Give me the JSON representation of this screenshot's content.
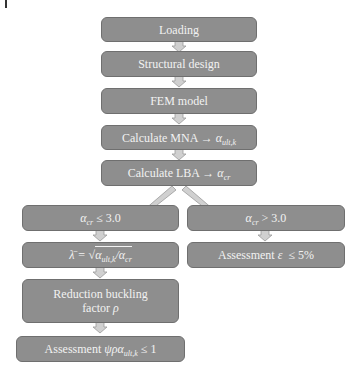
{
  "figure": {
    "corner_mark": "|",
    "nodes": {
      "loading": "Loading",
      "structural_design": "Structural design",
      "fem_model": "FEM model",
      "mna": {
        "prefix": "Calculate MNA → ",
        "symbol": "α",
        "sub": "ult,k"
      },
      "lba": {
        "prefix": "Calculate LBA → ",
        "symbol": "α",
        "sub": "cr"
      },
      "branch_left": {
        "symbol": "α",
        "sub": "cr",
        "suffix": " ≤ 3.0"
      },
      "branch_right": {
        "symbol": "α",
        "sub": "cr",
        "suffix": " > 3.0"
      },
      "slenderness": {
        "lhs": "λ̄ = √",
        "a1": "α",
        "s1": "ult,k",
        "sep": "/",
        "a2": "α",
        "s2": "cr"
      },
      "reduction": {
        "line1": "Reduction buckling",
        "line2_prefix": "factor ",
        "line2_symbol": "ρ"
      },
      "assessment_left": {
        "prefix": "Assessment ",
        "symbol": "ψρα",
        "sub": "ult,k",
        "suffix": " ≤ 1"
      },
      "assessment_right": {
        "prefix": "Assessment ",
        "symbol": "ε",
        "suffix": "  ≤ 5%"
      }
    },
    "colors": {
      "box_fill": "#8e8e8e",
      "box_border": "#6f6f6f",
      "text": "#f2f2f2",
      "arrow_fill": "#d0d0d0",
      "arrow_stroke": "#9a9a9a"
    }
  }
}
